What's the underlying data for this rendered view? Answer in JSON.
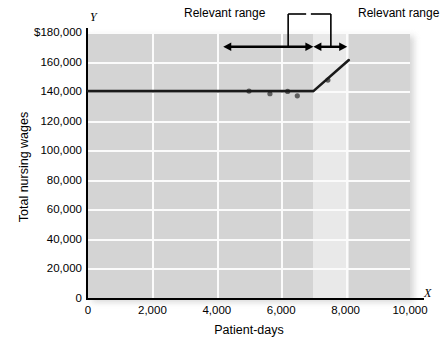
{
  "chart_data": {
    "type": "line",
    "title": "",
    "xlabel": "Patient-days",
    "ylabel": "Total nursing wages",
    "x_axis_letter": "Y",
    "y_axis_letter": "X",
    "xlim": [
      0,
      10000
    ],
    "ylim": [
      0,
      180000
    ],
    "grid": true,
    "legend": "none",
    "xticks": [
      0,
      2000,
      4000,
      6000,
      8000,
      10000
    ],
    "xticklabels": [
      "0",
      "2,000",
      "4,000",
      "6,000",
      "8,000",
      "10,000"
    ],
    "yticks": [
      0,
      20000,
      40000,
      60000,
      80000,
      100000,
      120000,
      140000,
      160000,
      180000
    ],
    "yticklabels": [
      "0",
      "20,000",
      "40,000",
      "60,000",
      "80,000",
      "100,000",
      "120,000",
      "140,000",
      "160,000",
      "$180,000"
    ],
    "series": [
      {
        "name": "Total nursing wages (step-fixed cost)",
        "type": "line",
        "color": "#1a1a1a",
        "x": [
          0,
          7000,
          8100
        ],
        "values": [
          140000,
          140000,
          161000
        ]
      },
      {
        "name": "Observed data points",
        "type": "scatter",
        "color": "#5e5e5e",
        "points": [
          {
            "x": 5000,
            "y": 140000
          },
          {
            "x": 5650,
            "y": 138200
          },
          {
            "x": 6200,
            "y": 139800
          },
          {
            "x": 6500,
            "y": 136800
          },
          {
            "x": 7450,
            "y": 147500
          }
        ]
      }
    ],
    "annotations": [
      {
        "name": "relevant-range-left",
        "label": "Relevant range",
        "x_start": 4200,
        "x_end": 7000,
        "y": 170000
      },
      {
        "name": "relevant-range-right",
        "label": "Relevant range",
        "x_start": 7000,
        "x_end": 8050,
        "y": 170000
      }
    ],
    "shaded_band": {
      "x_start": 7000,
      "x_end": 8100,
      "color": "#e9e9e9"
    }
  },
  "axes": {
    "y_letter": "Y",
    "x_letter": "X",
    "y_title": "Total nursing wages",
    "x_title": "Patient-days"
  },
  "colors": {
    "plot_background": "#d4d4d4",
    "band_background": "#e9e9e9",
    "gridline": "#fbfbfb",
    "line": "#1a1a1a",
    "marker": "#5e5e5e",
    "text": "#000000",
    "page_background": "#ffffff"
  }
}
